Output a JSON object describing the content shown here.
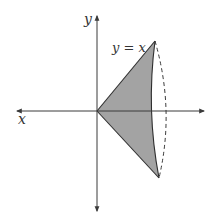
{
  "figure": {
    "labels": {
      "y_axis": "y",
      "x_axis": "x",
      "curve": "y = x"
    },
    "colors": {
      "axis": "#3a3a3a",
      "shade": "#a3a3a3",
      "outline": "#2e2e2e",
      "dashed": "#3a3a3a",
      "background": "#ffffff"
    }
  }
}
